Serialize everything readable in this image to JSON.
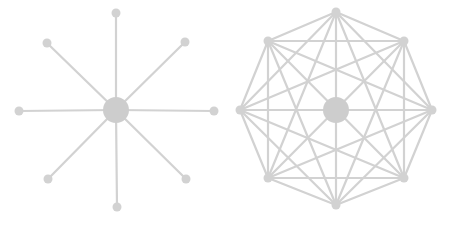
{
  "colors": {
    "background": "#ffffff",
    "edge": "#d2d2d2",
    "node": "#d2d2d2",
    "hub": "#cdcdcd"
  },
  "diagrams": [
    {
      "name": "star-topology",
      "hub": {
        "x": 116,
        "y": 110,
        "r": 13
      },
      "node_radius": 4.5,
      "edge_width": 2.2,
      "nodes": [
        {
          "x": 116,
          "y": 13
        },
        {
          "x": 185,
          "y": 42
        },
        {
          "x": 214,
          "y": 111
        },
        {
          "x": 186,
          "y": 179
        },
        {
          "x": 117,
          "y": 207
        },
        {
          "x": 48,
          "y": 179
        },
        {
          "x": 19,
          "y": 111
        },
        {
          "x": 47,
          "y": 43
        }
      ],
      "edges": "hub-to-each-node"
    },
    {
      "name": "full-mesh-topology",
      "hub": {
        "x": 336,
        "y": 110,
        "r": 13
      },
      "node_radius": 4.5,
      "edge_width": 2.2,
      "nodes": [
        {
          "x": 336,
          "y": 12
        },
        {
          "x": 404,
          "y": 41
        },
        {
          "x": 432,
          "y": 110
        },
        {
          "x": 404,
          "y": 178
        },
        {
          "x": 336,
          "y": 205
        },
        {
          "x": 268,
          "y": 178
        },
        {
          "x": 240,
          "y": 110
        },
        {
          "x": 268,
          "y": 41
        }
      ],
      "edges": "every-pair-of-nodes"
    }
  ]
}
